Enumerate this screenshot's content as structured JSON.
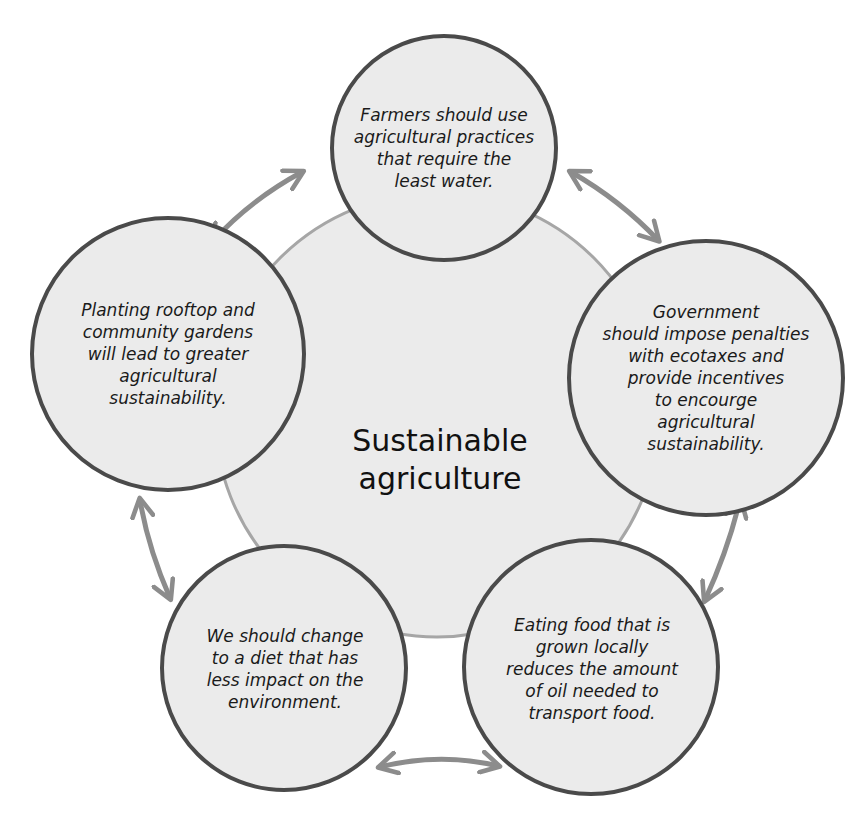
{
  "center": {
    "title": "Sustainable\nagriculture"
  },
  "nodes": [
    {
      "id": "top",
      "text": "Farmers should use\nagricultural practices\nthat require the\nleast water."
    },
    {
      "id": "right",
      "text": "Government\nshould impose penalties\nwith ecotaxes and\nprovide incentives\nto encourge\nagricultural\nsustainability."
    },
    {
      "id": "bottom-right",
      "text": "Eating food that is\ngrown locally\nreduces the amount\nof oil needed to\ntransport food."
    },
    {
      "id": "bottom-left",
      "text": "We should change\nto a diet that has\nless impact on the\nenvironment."
    },
    {
      "id": "left",
      "text": "Planting rooftop and\ncommunity gardens\nwill lead to greater\nagricultural\nsustainability."
    }
  ],
  "connections": [
    {
      "from": "left",
      "to": "top",
      "type": "bidirectional-arrow"
    },
    {
      "from": "top",
      "to": "right",
      "type": "bidirectional-arrow"
    },
    {
      "from": "right",
      "to": "bottom-right",
      "type": "bidirectional-arrow"
    },
    {
      "from": "bottom-right",
      "to": "bottom-left",
      "type": "bidirectional-arrow"
    },
    {
      "from": "bottom-left",
      "to": "left",
      "type": "bidirectional-arrow"
    }
  ],
  "colors": {
    "background": "#ffffff",
    "circle_fill": "#ebebeb",
    "circle_stroke": "#4a4a4a",
    "center_stroke": "#a6a6a6",
    "arrow": "#8c8c8c",
    "text": "#1a1a1a"
  }
}
